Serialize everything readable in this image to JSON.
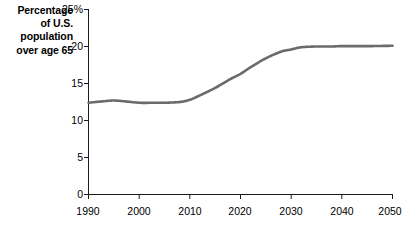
{
  "figure": {
    "axis_title_lines": [
      "Percentage",
      "of U.S.",
      "population",
      "over age 65"
    ],
    "line_color": "#6b6b6b",
    "axis_color": "#1a1a1a",
    "background": "#ffffff"
  },
  "chart_data": {
    "type": "line",
    "title": "",
    "subtitle": "",
    "xlabel": "",
    "ylabel": "Percentage of U.S. population over age 65",
    "xlim": [
      1990,
      2050
    ],
    "ylim": [
      0,
      25
    ],
    "xticks": [
      1990,
      2000,
      2010,
      2020,
      2030,
      2040,
      2050
    ],
    "xtick_labels": [
      "1990",
      "2000",
      "2010",
      "2020",
      "2030",
      "2040",
      "2050"
    ],
    "yticks": [
      0,
      5,
      10,
      15,
      20,
      25
    ],
    "ytick_labels": [
      "0",
      "5",
      "10",
      "15",
      "20",
      "25%"
    ],
    "grid": false,
    "legend": false,
    "legend_position": "none",
    "series": [
      {
        "name": "Percentage of U.S. population over age 65",
        "x": [
          1990,
          1993,
          1995,
          1997,
          2000,
          2003,
          2005,
          2008,
          2010,
          2012,
          2015,
          2018,
          2020,
          2022,
          2025,
          2028,
          2030,
          2032,
          2035,
          2038,
          2040,
          2045,
          2050
        ],
        "values": [
          12.4,
          12.6,
          12.7,
          12.6,
          12.4,
          12.4,
          12.4,
          12.5,
          12.8,
          13.4,
          14.4,
          15.6,
          16.3,
          17.2,
          18.4,
          19.3,
          19.6,
          19.9,
          20.0,
          20.0,
          20.05,
          20.05,
          20.1
        ]
      }
    ],
    "annotations": []
  }
}
